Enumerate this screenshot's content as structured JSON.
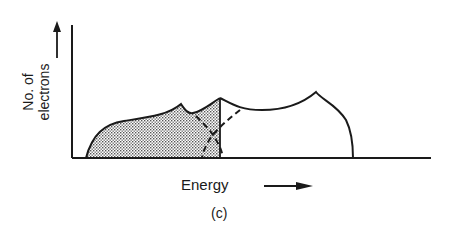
{
  "figure": {
    "caption": "(c)",
    "y_axis_label_line1": "No. of",
    "y_axis_label_line2": "electrons",
    "x_axis_label": "Energy",
    "colors": {
      "ink": "#1a1a1a",
      "fill": "#bdbdbd",
      "background": "#ffffff"
    }
  }
}
